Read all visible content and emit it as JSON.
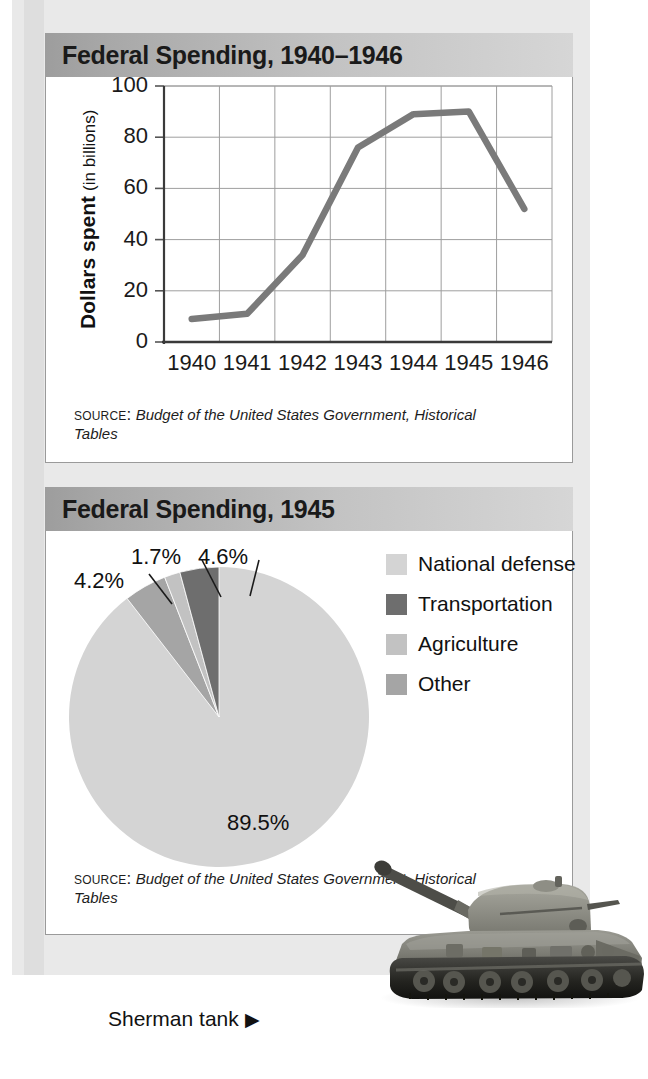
{
  "frame": {
    "background_color": "#e9e9e9"
  },
  "line_panel": {
    "title": "Federal Spending, 1940–1946",
    "source_label": "Source:",
    "source_text": "Budget of the United States Government, Historical Tables"
  },
  "pie_panel": {
    "title": "Federal Spending, 1945",
    "source_label": "Source:",
    "source_text": "Budget of the United States Government, Historical Tables"
  },
  "photo": {
    "caption": "Sherman tank",
    "caption_arrow": "▶",
    "alt": "sherman-tank-photo"
  },
  "chart_data": [
    {
      "type": "line",
      "title": "Federal Spending, 1940–1946",
      "xlabel": "",
      "ylabel": "Dollars spent (in billions)",
      "ylabel_main": "Dollars spent",
      "ylabel_unit": "(in billions)",
      "categories": [
        "1940",
        "1941",
        "1942",
        "1943",
        "1944",
        "1945",
        "1946"
      ],
      "values": [
        9,
        11,
        34,
        76,
        89,
        90,
        52
      ],
      "ylim": [
        0,
        100
      ],
      "yticks": [
        0,
        20,
        40,
        60,
        80,
        100
      ],
      "ytick_labels": [
        "0",
        "20",
        "40",
        "60",
        "80",
        "100"
      ],
      "grid": true,
      "legend": "none",
      "series_color": "#7a7a7a",
      "source": "Budget of the United States Government, Historical Tables"
    },
    {
      "type": "pie",
      "title": "Federal Spending, 1945",
      "labels": [
        "National defense",
        "Transportation",
        "Agriculture",
        "Other"
      ],
      "values": [
        89.5,
        4.2,
        1.7,
        4.6
      ],
      "value_labels": [
        "89.5%",
        "4.2%",
        "1.7%",
        "4.6%"
      ],
      "colors": [
        "#d4d4d4",
        "#6e6e6e",
        "#c2c2c2",
        "#a5a5a5"
      ],
      "legend": "right",
      "source": "Budget of the United States Government, Historical Tables"
    }
  ]
}
